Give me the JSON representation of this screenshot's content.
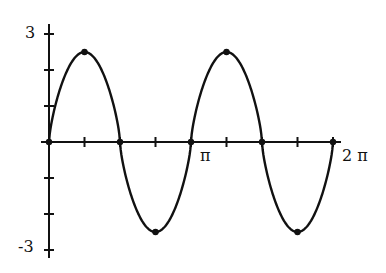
{
  "chart_data": {
    "type": "line",
    "title": "",
    "xlabel": "",
    "ylabel": "",
    "xlim": [
      0,
      6.2832
    ],
    "ylim": [
      -3,
      3
    ],
    "grid": false,
    "legend": null,
    "x_tick_labels": [
      "π",
      "2 π"
    ],
    "y_tick_labels": [
      "3",
      "-3"
    ],
    "x_ticks": [
      0,
      0.7854,
      1.5708,
      2.3562,
      3.1416,
      3.927,
      4.7124,
      5.4978,
      6.2832
    ],
    "y_ticks": [
      -3,
      -2,
      -1,
      0,
      1,
      2,
      3
    ],
    "series": [
      {
        "name": "curve",
        "x": [
          0,
          0.7854,
          1.5708,
          2.3562,
          3.1416,
          3.927,
          4.7124,
          5.4978,
          6.2832
        ],
        "values": [
          0,
          2.5,
          0,
          -2.5,
          0,
          2.5,
          0,
          -2.5,
          0
        ]
      }
    ],
    "marked_points": [
      {
        "x": 0,
        "y": 0
      },
      {
        "x": 0.7854,
        "y": 2.5
      },
      {
        "x": 1.5708,
        "y": 0
      },
      {
        "x": 2.3562,
        "y": -2.5
      },
      {
        "x": 3.1416,
        "y": 0
      },
      {
        "x": 3.927,
        "y": 2.5
      },
      {
        "x": 4.7124,
        "y": 0
      },
      {
        "x": 5.4978,
        "y": -2.5
      },
      {
        "x": 6.2832,
        "y": 0
      }
    ]
  },
  "labels": {
    "y_top": "3",
    "y_bottom": "-3",
    "x_pi": "π",
    "x_2pi": "2 π"
  }
}
